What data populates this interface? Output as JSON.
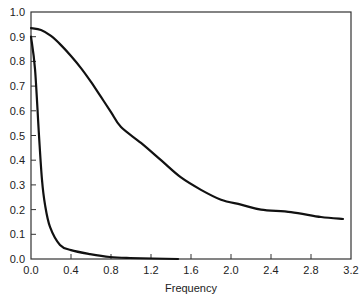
{
  "chart_data": {
    "type": "line",
    "title": "",
    "xlabel": "Frequency",
    "ylabel": "",
    "xlim": [
      0,
      3.2
    ],
    "ylim": [
      0,
      1.0
    ],
    "grid": false,
    "legend": null,
    "x_ticks": [
      "0.0",
      "0.4",
      "0.8",
      "1.2",
      "1.6",
      "2.0",
      "2.4",
      "2.8",
      "3.2"
    ],
    "y_ticks": [
      "0.0",
      "0.1",
      "0.2",
      "0.3",
      "0.4",
      "0.5",
      "0.6",
      "0.7",
      "0.8",
      "0.9",
      "1.0"
    ],
    "series": [
      {
        "name": "broad-curve",
        "x": [
          0.0,
          0.1,
          0.2,
          0.3,
          0.4,
          0.5,
          0.6,
          0.7,
          0.8,
          0.9,
          1.1,
          1.3,
          1.5,
          1.7,
          1.9,
          2.1,
          2.3,
          2.6,
          2.9,
          3.12
        ],
        "y": [
          0.935,
          0.927,
          0.903,
          0.866,
          0.822,
          0.773,
          0.717,
          0.656,
          0.595,
          0.534,
          0.47,
          0.4,
          0.33,
          0.28,
          0.24,
          0.22,
          0.2,
          0.19,
          0.17,
          0.162
        ]
      },
      {
        "name": "narrow-curve",
        "x": [
          0.0,
          0.04,
          0.08,
          0.11,
          0.14,
          0.19,
          0.29,
          0.4,
          0.59,
          0.79,
          0.99,
          1.47
        ],
        "y": [
          0.9,
          0.77,
          0.5,
          0.32,
          0.22,
          0.13,
          0.057,
          0.036,
          0.02,
          0.008,
          0.004,
          0.0
        ]
      }
    ]
  },
  "colors": {
    "line": "#111111",
    "frame": "#333333",
    "background": "#ffffff"
  }
}
